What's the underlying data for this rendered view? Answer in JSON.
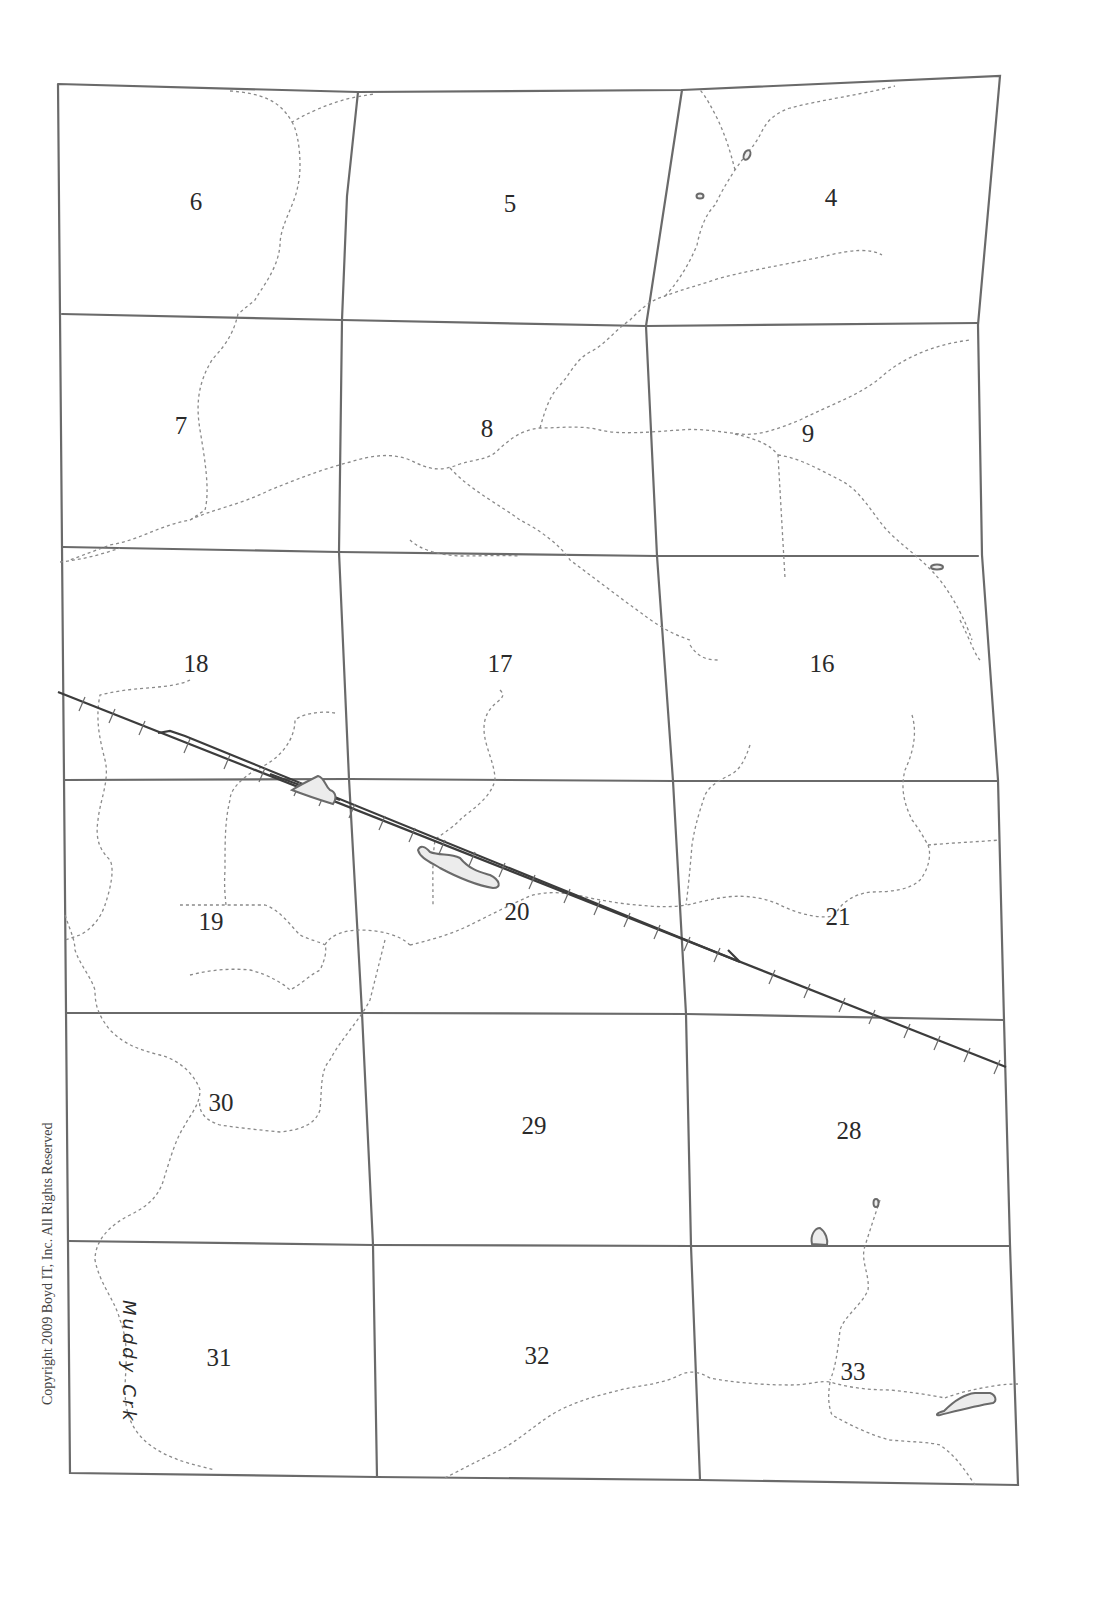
{
  "map": {
    "type": "township-section-plat",
    "copyright": "Copyright 2009 Boyd IT, Inc. All Rights Reserved",
    "creek_label": "Muddy Crk",
    "colors": {
      "grid_line": "#6a6a6a",
      "creek_line": "#8a8a8a",
      "railroad": "#3c3c3c",
      "pond_fill": "#ececec",
      "background": "#ffffff"
    },
    "sections": [
      {
        "number": "6",
        "row": 1,
        "col": 1
      },
      {
        "number": "5",
        "row": 1,
        "col": 2
      },
      {
        "number": "4",
        "row": 1,
        "col": 3
      },
      {
        "number": "7",
        "row": 2,
        "col": 1
      },
      {
        "number": "8",
        "row": 2,
        "col": 2
      },
      {
        "number": "9",
        "row": 2,
        "col": 3
      },
      {
        "number": "18",
        "row": 3,
        "col": 1
      },
      {
        "number": "17",
        "row": 3,
        "col": 2
      },
      {
        "number": "16",
        "row": 3,
        "col": 3
      },
      {
        "number": "19",
        "row": 4,
        "col": 1
      },
      {
        "number": "20",
        "row": 4,
        "col": 2
      },
      {
        "number": "21",
        "row": 4,
        "col": 3
      },
      {
        "number": "30",
        "row": 5,
        "col": 1
      },
      {
        "number": "29",
        "row": 5,
        "col": 2
      },
      {
        "number": "28",
        "row": 5,
        "col": 3
      },
      {
        "number": "31",
        "row": 6,
        "col": 1
      },
      {
        "number": "32",
        "row": 6,
        "col": 2
      },
      {
        "number": "33",
        "row": 6,
        "col": 3
      }
    ],
    "features": {
      "railroad": "double-track railroad with tick marks crossing sections 18, 19, 20, 21, 28",
      "creeks": "dashed intermittent streams",
      "ponds": "small water bodies in sections 4, 9, 18/19, 20, 28/33, 33"
    }
  }
}
